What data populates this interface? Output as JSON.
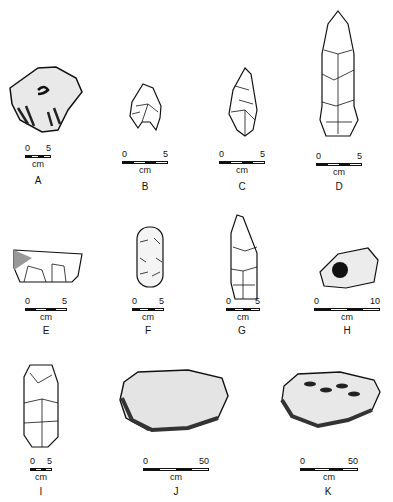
{
  "figure": {
    "artifacts": [
      {
        "id": "A",
        "scale_min": "0",
        "scale_max": "5",
        "unit": "cm"
      },
      {
        "id": "B",
        "scale_min": "0",
        "scale_max": "5",
        "unit": "cm"
      },
      {
        "id": "C",
        "scale_min": "0",
        "scale_max": "5",
        "unit": "cm"
      },
      {
        "id": "D",
        "scale_min": "0",
        "scale_max": "5",
        "unit": "cm"
      },
      {
        "id": "E",
        "scale_min": "0",
        "scale_max": "5",
        "unit": "cm"
      },
      {
        "id": "F",
        "scale_min": "0",
        "scale_max": "5",
        "unit": "cm"
      },
      {
        "id": "G",
        "scale_min": "0",
        "scale_max": "5",
        "unit": "cm"
      },
      {
        "id": "H",
        "scale_min": "0",
        "scale_max": "10",
        "unit": "cm"
      },
      {
        "id": "I",
        "scale_min": "0",
        "scale_max": "5",
        "unit": "cm"
      },
      {
        "id": "J",
        "scale_min": "0",
        "scale_max": "50",
        "unit": "cm"
      },
      {
        "id": "K",
        "scale_min": "0",
        "scale_max": "50",
        "unit": "cm"
      }
    ]
  }
}
